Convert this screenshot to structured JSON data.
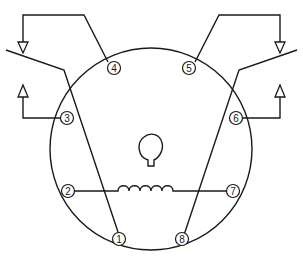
{
  "diagram": {
    "type": "connector-pinout",
    "colors": {
      "line": "#1a1a1a",
      "background": "#ffffff"
    },
    "pins": [
      {
        "id": "1",
        "label": "1"
      },
      {
        "id": "2",
        "label": "2"
      },
      {
        "id": "3",
        "label": "3"
      },
      {
        "id": "4",
        "label": "4"
      },
      {
        "id": "5",
        "label": "5"
      },
      {
        "id": "6",
        "label": "6"
      },
      {
        "id": "7",
        "label": "7"
      },
      {
        "id": "8",
        "label": "8"
      }
    ],
    "connections": [
      {
        "from": "2",
        "to": "7",
        "via": "coil"
      },
      {
        "from": "1",
        "to": "left-switch-contact"
      },
      {
        "from": "8",
        "to": "right-switch-contact"
      },
      {
        "from": "4",
        "to": "left-upper-arrow"
      },
      {
        "from": "3",
        "to": "left-lower-arrow"
      },
      {
        "from": "5",
        "to": "right-upper-arrow"
      },
      {
        "from": "6",
        "to": "right-lower-arrow"
      }
    ]
  }
}
